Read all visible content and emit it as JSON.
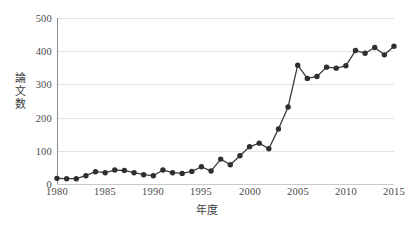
{
  "chart_data": {
    "type": "line",
    "title": "",
    "xlabel": "年度",
    "ylabel": "論文数",
    "xlim": [
      1980,
      2015
    ],
    "ylim": [
      0,
      500
    ],
    "grid": true,
    "legend": false,
    "marker": "filled-circle",
    "series_color": "#2f2f2f",
    "grid_color": "#e3e3e3",
    "axis_color": "#8c8c8c",
    "x_ticks": [
      "1980",
      "1985",
      "1990",
      "1995",
      "2000",
      "2005",
      "2010",
      "2015"
    ],
    "y_ticks": [
      "0",
      "100",
      "200",
      "300",
      "400",
      "500"
    ],
    "x": [
      1980,
      1981,
      1982,
      1983,
      1984,
      1985,
      1986,
      1987,
      1988,
      1989,
      1990,
      1991,
      1992,
      1993,
      1994,
      1995,
      1996,
      1997,
      1998,
      1999,
      2000,
      2001,
      2002,
      2003,
      2004,
      2005,
      2006,
      2007,
      2008,
      2009,
      2010,
      2011,
      2012,
      2013,
      2014,
      2015
    ],
    "values": [
      17,
      16,
      16,
      25,
      37,
      34,
      42,
      41,
      34,
      28,
      25,
      42,
      34,
      32,
      38,
      52,
      39,
      75,
      58,
      85,
      112,
      123,
      106,
      166,
      232,
      358,
      318,
      324,
      352,
      349,
      356,
      402,
      394,
      411,
      389,
      415
    ],
    "series": [
      {
        "name": "論文数",
        "values": [
          17,
          16,
          16,
          25,
          37,
          34,
          42,
          41,
          34,
          28,
          25,
          42,
          34,
          32,
          38,
          52,
          39,
          75,
          58,
          85,
          112,
          123,
          106,
          166,
          232,
          358,
          318,
          324,
          352,
          349,
          356,
          402,
          394,
          411,
          389,
          415
        ]
      }
    ]
  }
}
